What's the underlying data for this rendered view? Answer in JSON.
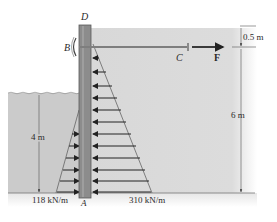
{
  "figure": {
    "type": "sheet-pile wall with tie rod",
    "labels": {
      "top_of_wall": "D",
      "tie_anchor": "B",
      "tie_end": "C",
      "force": "F",
      "base": "A"
    },
    "dimensions": {
      "top_offset": "0.5 m",
      "soil_height": "6 m",
      "water_height": "4 m"
    },
    "loads": {
      "water_pressure_max": "118 kN/m",
      "soil_pressure_max": "310 kN/m"
    },
    "colors": {
      "soil": "#d9d9d9",
      "water": "#c9c9c9",
      "wall": "#8a8a8a",
      "wall_edge": "#5a5a5a",
      "arrow": "#222222"
    }
  }
}
